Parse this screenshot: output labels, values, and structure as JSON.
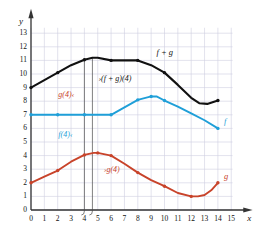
{
  "chart_data": {
    "type": "line",
    "title": "",
    "xlabel": "x",
    "ylabel": "y",
    "xlim": [
      0,
      15
    ],
    "ylim": [
      0,
      13.6
    ],
    "grid": true,
    "legend_position": "inline-curve-labels",
    "x_ticks": [
      "0",
      "1",
      "2",
      "3",
      "4",
      "5",
      "6",
      "7",
      "8",
      "9",
      "10",
      "11",
      "12",
      "13",
      "14",
      "15"
    ],
    "y_ticks": [
      "0",
      "1",
      "2",
      "3",
      "4",
      "5",
      "6",
      "7",
      "8",
      "9",
      "10",
      "11",
      "12",
      "13"
    ],
    "series": [
      {
        "name": "f + g",
        "color": "#111111",
        "label": "f + g",
        "label_x": 9.4,
        "label_y": 11.55,
        "x": [
          0,
          1,
          2,
          3,
          4,
          4.6,
          5,
          6,
          7,
          8,
          9,
          10,
          11,
          12,
          12.6,
          13.2,
          14
        ],
        "y": [
          9.0,
          9.55,
          10.1,
          10.65,
          11.05,
          11.2,
          11.2,
          11.0,
          11.0,
          11.0,
          10.65,
          10.1,
          9.2,
          8.25,
          7.85,
          7.8,
          8.05
        ],
        "markers_x": [
          0,
          2,
          4,
          6,
          8,
          10,
          14
        ],
        "markers_y": [
          9.0,
          10.1,
          11.05,
          11.0,
          11.0,
          10.1,
          8.05
        ]
      },
      {
        "name": "f",
        "color": "#1f9fd8",
        "label": "f",
        "label_x": 14.45,
        "label_y": 6.45,
        "x": [
          0,
          2,
          4,
          6,
          7,
          8,
          9,
          9.4,
          10,
          11,
          12,
          13,
          14
        ],
        "y": [
          7.0,
          7.0,
          7.0,
          7.0,
          7.55,
          8.1,
          8.35,
          8.35,
          8.05,
          7.6,
          7.1,
          6.6,
          6.0
        ],
        "markers_x": [
          0,
          2,
          4,
          6,
          8,
          9,
          10,
          14
        ],
        "markers_y": [
          7.0,
          7.0,
          7.0,
          7.0,
          8.1,
          8.35,
          8.05,
          6.0
        ]
      },
      {
        "name": "g",
        "color": "#c8432a",
        "label": "g",
        "label_x": 14.45,
        "label_y": 2.45,
        "x": [
          0,
          1,
          2,
          3,
          4,
          4.7,
          5,
          6,
          7,
          8,
          9,
          10,
          11,
          12,
          12.5,
          13,
          13.5,
          14
        ],
        "y": [
          2.0,
          2.45,
          2.9,
          3.55,
          4.05,
          4.2,
          4.2,
          4.0,
          3.4,
          2.75,
          2.2,
          1.75,
          1.25,
          1.0,
          1.0,
          1.1,
          1.45,
          2.0
        ],
        "markers_x": [
          0,
          2,
          4,
          5,
          6,
          8,
          10,
          12,
          14
        ],
        "markers_y": [
          2.0,
          2.9,
          4.05,
          4.2,
          4.0,
          2.75,
          1.75,
          1.0,
          2.0
        ]
      }
    ],
    "annotations": [
      {
        "id": "g4-upper",
        "text": "g(4)",
        "color": "#c8432a",
        "x": 2.05,
        "y": 8.35
      },
      {
        "id": "f4",
        "text": "f(4)",
        "color": "#1f9fd8",
        "x": 2.05,
        "y": 5.45
      },
      {
        "id": "fg4",
        "text": "(f + g)(4)",
        "color": "#111111",
        "x": 5.05,
        "y": 9.55
      },
      {
        "id": "g4-lower",
        "text": "g(4)",
        "color": "#c8432a",
        "x": 5.45,
        "y": 2.85
      }
    ],
    "measure_lines": [
      {
        "id": "measure-line-x4",
        "x": 4.0,
        "y_bottom": 0.0,
        "y_top": 11.05
      },
      {
        "id": "measure-line-x46",
        "x": 4.6,
        "y_bottom": 0.0,
        "y_top": 11.2
      }
    ]
  },
  "axes": {
    "x_axis_label": "x",
    "y_axis_label": "y"
  }
}
